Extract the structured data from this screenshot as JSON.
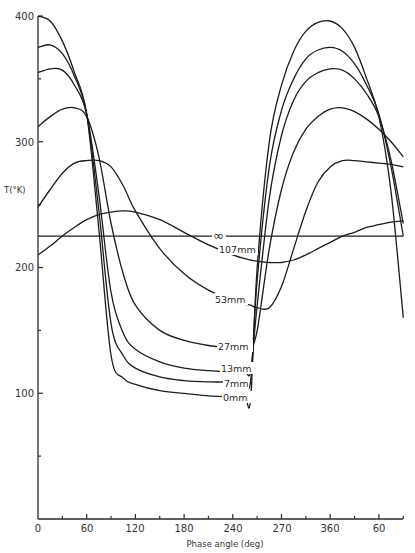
{
  "chart_data": {
    "type": "line",
    "title": "",
    "xlabel": "Phase angle (deg)",
    "ylabel": "T(°K)",
    "xlim": [
      0,
      450
    ],
    "ylim": [
      0,
      400
    ],
    "grid": false,
    "legend_position": "inline labels",
    "x_ticks": [
      {
        "value": 0,
        "label": "0"
      },
      {
        "value": 60,
        "label": "60"
      },
      {
        "value": 120,
        "label": "120"
      },
      {
        "value": 180,
        "label": "180"
      },
      {
        "value": 240,
        "label": "240"
      },
      {
        "value": 300,
        "label": "270"
      },
      {
        "value": 360,
        "label": "360"
      },
      {
        "value": 420,
        "label": "60"
      }
    ],
    "x_minor_ticks": [
      30,
      90,
      150,
      210,
      270,
      330,
      390,
      450
    ],
    "y_ticks": [
      {
        "value": 100,
        "label": "100"
      },
      {
        "value": 200,
        "label": "200"
      },
      {
        "value": 300,
        "label": "300"
      },
      {
        "value": 400,
        "label": "400"
      }
    ],
    "y_minor_ticks": [
      50,
      150,
      250,
      350
    ],
    "x": [
      0,
      15,
      30,
      45,
      60,
      75,
      90,
      105,
      120,
      150,
      180,
      210,
      240,
      255,
      262,
      270,
      285,
      300,
      315,
      330,
      345,
      360,
      375,
      390,
      405,
      420,
      435,
      450
    ],
    "series": [
      {
        "name": "0mm",
        "label_pos": [
          203,
          400
        ],
        "values": [
          400,
          396,
          380,
          355,
          322,
          230,
          130,
          112,
          107,
          102,
          100,
          98,
          97,
          96,
          96,
          200,
          300,
          345,
          372,
          388,
          395,
          396,
          390,
          375,
          350,
          320,
          260,
          160
        ]
      },
      {
        "name": "7mm",
        "label_pos": [
          210,
          383
        ],
        "values": [
          375,
          377,
          370,
          352,
          322,
          245,
          155,
          130,
          120,
          113,
          110,
          109,
          109,
          109,
          110,
          190,
          280,
          325,
          350,
          366,
          373,
          375,
          372,
          362,
          345,
          322,
          280,
          225
        ]
      },
      {
        "name": "13mm",
        "label_pos": [
          203,
          369
        ],
        "values": [
          355,
          358,
          357,
          345,
          322,
          258,
          180,
          148,
          135,
          125,
          120,
          118,
          117,
          117,
          118,
          170,
          255,
          305,
          333,
          348,
          355,
          358,
          357,
          350,
          338,
          320,
          285,
          235
        ]
      },
      {
        "name": "27mm",
        "label_pos": [
          214,
          345
        ],
        "values": [
          312,
          320,
          326,
          327,
          320,
          288,
          235,
          195,
          170,
          150,
          142,
          138,
          136,
          135,
          135,
          150,
          215,
          262,
          292,
          310,
          320,
          326,
          327,
          324,
          318,
          310,
          300,
          288
        ]
      },
      {
        "name": "53mm",
        "label_pos": [
          214,
          300
        ],
        "values": [
          248,
          262,
          275,
          283,
          285,
          285,
          280,
          265,
          245,
          215,
          195,
          182,
          174,
          171,
          170,
          168,
          168,
          185,
          215,
          245,
          268,
          280,
          285,
          285,
          284,
          283,
          282,
          280
        ]
      },
      {
        "name": "107mm",
        "label_pos": [
          218,
          250
        ],
        "values": [
          210,
          217,
          225,
          232,
          238,
          242,
          244,
          245,
          244,
          238,
          228,
          218,
          210,
          207,
          206,
          205,
          204,
          204,
          206,
          210,
          215,
          220,
          225,
          228,
          232,
          234,
          236,
          237
        ]
      },
      {
        "name": "∞",
        "label_pos": [
          226,
          238
        ],
        "values": [
          225,
          225,
          225,
          225,
          225,
          225,
          225,
          225,
          225,
          225,
          225,
          225,
          225,
          225,
          225,
          225,
          225,
          225,
          225,
          225,
          225,
          225,
          225,
          225,
          225,
          225,
          225,
          225
        ]
      }
    ]
  },
  "labels": {
    "y_axis_title": "T(°K)",
    "x_axis_title": "Phase angle (deg)",
    "inf": "∞",
    "c107": "107mm",
    "c53": "53mm",
    "c27": "27mm",
    "c13": "13mm",
    "c7": "7mm",
    "c0": "0mm",
    "y400": "400",
    "y300": "300",
    "y200": "200",
    "y100": "100",
    "x0": "0",
    "x60": "60",
    "x120": "120",
    "x180": "180",
    "x240": "240",
    "x270": "270",
    "x360": "360",
    "x60b": "60"
  }
}
